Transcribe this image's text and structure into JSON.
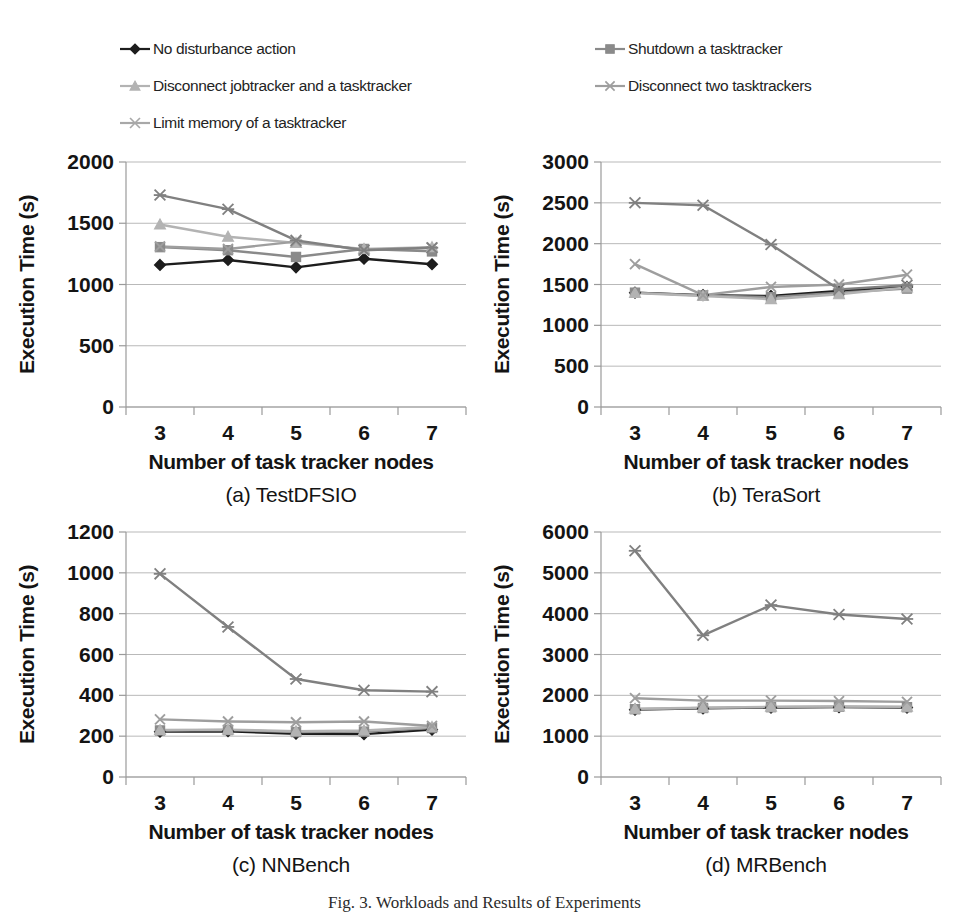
{
  "figure": {
    "caption": "Fig. 3. Workloads and Results of Experiments"
  },
  "legend": {
    "position": "top",
    "entries": [
      {
        "label": "No disturbance action",
        "marker": "diamond-marker",
        "color": "#1d1d1d"
      },
      {
        "label": "Shutdown a tasktracker",
        "marker": "square-marker",
        "color": "#8a8a8a"
      },
      {
        "label": "Disconnect jobtracker and a tasktracker",
        "marker": "triangle-marker",
        "color": "#b3b3b3"
      },
      {
        "label": "Disconnect two tasktrackers",
        "marker": "cross-marker",
        "color": "#9e9e9e"
      },
      {
        "label": "Limit memory of a tasktracker",
        "marker": "asterisk-marker",
        "color": "#a8a8a8"
      }
    ]
  },
  "common": {
    "xlabel": "Number of task tracker nodes",
    "ylabel": "Execution Time (s)",
    "categories": [
      "3",
      "4",
      "5",
      "6",
      "7"
    ]
  },
  "chart_data": [
    {
      "id": "chart-a",
      "type": "line",
      "title": "(a) TestDFSIO",
      "xlabel": "Number of task tracker nodes",
      "ylabel": "Execution Time (s)",
      "categories": [
        "3",
        "4",
        "5",
        "6",
        "7"
      ],
      "ylim": [
        0,
        2000
      ],
      "yticks": [
        0,
        500,
        1000,
        1500,
        2000
      ],
      "grid": true,
      "series": [
        {
          "name": "No disturbance action",
          "marker": "diamond-marker",
          "color": "#1d1d1d",
          "values": [
            1160,
            1200,
            1140,
            1210,
            1165
          ]
        },
        {
          "name": "Shutdown a tasktracker",
          "marker": "square-marker",
          "color": "#8a8a8a",
          "values": [
            1305,
            1280,
            1225,
            1290,
            1270
          ]
        },
        {
          "name": "Disconnect jobtracker and a tasktracker",
          "marker": "triangle-marker",
          "color": "#b3b3b3",
          "values": [
            1490,
            1390,
            1340,
            1290,
            1305
          ]
        },
        {
          "name": "Disconnect two tasktrackers",
          "marker": "cross-marker",
          "color": "#9e9e9e",
          "values": [
            1310,
            1290,
            1350,
            1285,
            1300
          ]
        },
        {
          "name": "Limit memory of a tasktracker",
          "marker": "asterisk-marker",
          "color": "#808080",
          "values": [
            1730,
            1615,
            1360,
            1280,
            1300
          ]
        }
      ]
    },
    {
      "id": "chart-b",
      "type": "line",
      "title": "(b) TeraSort",
      "xlabel": "Number of task tracker nodes",
      "ylabel": "Execution Time (s)",
      "categories": [
        "3",
        "4",
        "5",
        "6",
        "7"
      ],
      "ylim": [
        0,
        3000
      ],
      "yticks": [
        0,
        500,
        1000,
        1500,
        2000,
        2500,
        3000
      ],
      "grid": true,
      "series": [
        {
          "name": "No disturbance action",
          "marker": "diamond-marker",
          "color": "#1d1d1d",
          "values": [
            1400,
            1370,
            1360,
            1420,
            1470
          ]
        },
        {
          "name": "Shutdown a tasktracker",
          "marker": "square-marker",
          "color": "#8a8a8a",
          "values": [
            1400,
            1365,
            1345,
            1400,
            1450
          ]
        },
        {
          "name": "Disconnect jobtracker and a tasktracker",
          "marker": "triangle-marker",
          "color": "#b3b3b3",
          "values": [
            1395,
            1360,
            1320,
            1380,
            1465
          ]
        },
        {
          "name": "Disconnect two tasktrackers",
          "marker": "cross-marker",
          "color": "#9e9e9e",
          "values": [
            1750,
            1370,
            1470,
            1500,
            1620
          ]
        },
        {
          "name": "Limit memory of a tasktracker",
          "marker": "asterisk-marker",
          "color": "#808080",
          "values": [
            2500,
            2470,
            1990,
            1440,
            1490
          ]
        }
      ]
    },
    {
      "id": "chart-c",
      "type": "line",
      "title": "(c) NNBench",
      "xlabel": "Number of task tracker nodes",
      "ylabel": "Execution Time (s)",
      "categories": [
        "3",
        "4",
        "5",
        "6",
        "7"
      ],
      "ylim": [
        0,
        1200
      ],
      "yticks": [
        0,
        200,
        400,
        600,
        800,
        1000,
        1200
      ],
      "grid": true,
      "series": [
        {
          "name": "No disturbance action",
          "marker": "diamond-marker",
          "color": "#1d1d1d",
          "values": [
            222,
            224,
            212,
            210,
            232
          ]
        },
        {
          "name": "Shutdown a tasktracker",
          "marker": "square-marker",
          "color": "#8a8a8a",
          "values": [
            228,
            230,
            220,
            222,
            240
          ]
        },
        {
          "name": "Disconnect jobtracker and a tasktracker",
          "marker": "triangle-marker",
          "color": "#b3b3b3",
          "values": [
            230,
            232,
            224,
            228,
            245
          ]
        },
        {
          "name": "Disconnect two tasktrackers",
          "marker": "cross-marker",
          "color": "#9e9e9e",
          "values": [
            282,
            272,
            268,
            272,
            250
          ]
        },
        {
          "name": "Limit memory of a tasktracker",
          "marker": "asterisk-marker",
          "color": "#808080",
          "values": [
            995,
            735,
            480,
            425,
            418
          ]
        }
      ]
    },
    {
      "id": "chart-d",
      "type": "line",
      "title": "(d) MRBench",
      "xlabel": "Number of task tracker nodes",
      "ylabel": "Execution Time (s)",
      "categories": [
        "3",
        "4",
        "5",
        "6",
        "7"
      ],
      "ylim": [
        0,
        6000
      ],
      "yticks": [
        0,
        1000,
        2000,
        3000,
        4000,
        5000,
        6000
      ],
      "grid": true,
      "series": [
        {
          "name": "No disturbance action",
          "marker": "diamond-marker",
          "color": "#1d1d1d",
          "values": [
            1650,
            1680,
            1700,
            1710,
            1700
          ]
        },
        {
          "name": "Shutdown a tasktracker",
          "marker": "square-marker",
          "color": "#8a8a8a",
          "values": [
            1660,
            1690,
            1710,
            1720,
            1710
          ]
        },
        {
          "name": "Disconnect jobtracker and a tasktracker",
          "marker": "triangle-marker",
          "color": "#b3b3b3",
          "values": [
            1670,
            1700,
            1720,
            1730,
            1720
          ]
        },
        {
          "name": "Disconnect two tasktrackers",
          "marker": "cross-marker",
          "color": "#9e9e9e",
          "values": [
            1930,
            1870,
            1870,
            1860,
            1840
          ]
        },
        {
          "name": "Limit memory of a tasktracker",
          "marker": "asterisk-marker",
          "color": "#808080",
          "values": [
            5540,
            3470,
            4210,
            3980,
            3870
          ]
        }
      ]
    }
  ]
}
